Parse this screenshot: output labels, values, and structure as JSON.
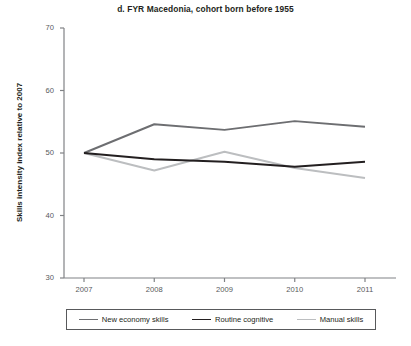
{
  "chart_data": {
    "type": "line",
    "title": "d. FYR Macedonia, cohort born before 1955",
    "xlabel": "",
    "ylabel": "Skills intensity index relative to 2007",
    "x": [
      "2007",
      "2008",
      "2009",
      "2010",
      "2011"
    ],
    "xticklabels": [
      "2007",
      "2008",
      "2009",
      "2010",
      "2011"
    ],
    "yticklabels": [
      "30",
      "40",
      "50",
      "60",
      "70"
    ],
    "ylim": [
      30,
      70
    ],
    "ytick_values": [
      30,
      40,
      50,
      60,
      70
    ],
    "grid": false,
    "legend_position": "bottom",
    "series": [
      {
        "name": "New economy skills",
        "color": "#6d6e71",
        "width": 1.9,
        "values": [
          50.0,
          54.6,
          53.7,
          55.1,
          54.2
        ]
      },
      {
        "name": "Routine cognitive",
        "color": "#231f20",
        "width": 1.9,
        "values": [
          50.0,
          49.0,
          48.6,
          47.8,
          48.6
        ]
      },
      {
        "name": "Manual skills",
        "color": "#bcbec0",
        "width": 1.9,
        "values": [
          50.0,
          47.2,
          50.2,
          47.6,
          46.0
        ]
      }
    ]
  },
  "axes": {
    "axis_color": "#808285",
    "tick_color": "#808285"
  }
}
